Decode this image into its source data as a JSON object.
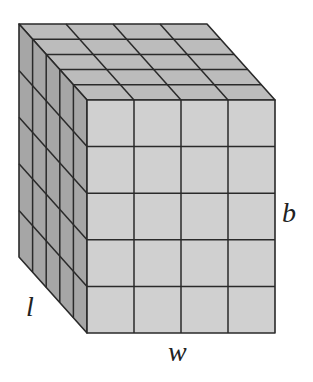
{
  "figure": {
    "cubes": {
      "width": 4,
      "height": 5,
      "depth": 5
    },
    "colors": {
      "front_face": "#d0d0d0",
      "top_face": "#bcbcbc",
      "left_face": "#a6a6a6",
      "grid_line": "#2a2a2a"
    },
    "geometry": {
      "front_top_left": [
        87,
        100
      ],
      "front_bottom_right": [
        275,
        333
      ],
      "depth_offset": [
        -68,
        -76
      ]
    }
  },
  "labels": {
    "length": "l",
    "width": "w",
    "height": "b"
  }
}
